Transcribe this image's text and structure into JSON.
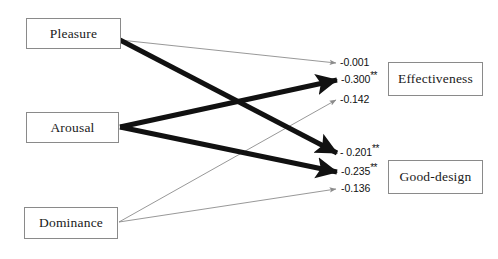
{
  "diagram": {
    "type": "path-diagram",
    "background_color": "#ffffff",
    "predictors": [
      {
        "id": "pleasure",
        "label": "Pleasure",
        "x": 26,
        "y": 18,
        "w": 95,
        "h": 31
      },
      {
        "id": "arousal",
        "label": "Arousal",
        "x": 26,
        "y": 112,
        "w": 93,
        "h": 31
      },
      {
        "id": "dominance",
        "label": "Dominance",
        "x": 24,
        "y": 207,
        "w": 94,
        "h": 32
      }
    ],
    "outcomes": [
      {
        "id": "effectiveness",
        "label": "Effectiveness",
        "x": 388,
        "y": 62,
        "w": 95,
        "h": 34
      },
      {
        "id": "good-design",
        "label": "Good-design",
        "x": 388,
        "y": 160,
        "w": 95,
        "h": 34
      }
    ],
    "paths": [
      {
        "id": "pleasure-effectiveness",
        "from": "pleasure",
        "to": "effectiveness",
        "coefficient": "-0.001",
        "stars": "",
        "significant": false,
        "weight": "thin",
        "stroke_width": 0.8,
        "color": "#7d7d7d",
        "x1": 120,
        "y1": 40,
        "x2": 336,
        "y2": 63,
        "label_x": 340,
        "label_y": 56
      },
      {
        "id": "arousal-effectiveness",
        "from": "arousal",
        "to": "effectiveness",
        "coefficient": "-0.300",
        "stars": "**",
        "significant": true,
        "weight": "thick",
        "stroke_width": 5.0,
        "color": "#111111",
        "x1": 120,
        "y1": 127,
        "x2": 337,
        "y2": 80,
        "label_x": 341,
        "label_y": 73
      },
      {
        "id": "dominance-effectiveness",
        "from": "dominance",
        "to": "effectiveness",
        "coefficient": "-0.142",
        "stars": "",
        "significant": false,
        "weight": "thin",
        "stroke_width": 0.8,
        "color": "#7d7d7d",
        "x1": 119,
        "y1": 222,
        "x2": 336,
        "y2": 100,
        "label_x": 340,
        "label_y": 93
      },
      {
        "id": "pleasure-good-design",
        "from": "pleasure",
        "to": "good-design",
        "coefficient": "- 0.201",
        "stars": "**",
        "significant": true,
        "weight": "thick",
        "stroke_width": 5.0,
        "color": "#111111",
        "x1": 120,
        "y1": 40,
        "x2": 337,
        "y2": 153,
        "label_x": 340,
        "label_y": 146
      },
      {
        "id": "arousal-good-design",
        "from": "arousal",
        "to": "good-design",
        "coefficient": "-0.235",
        "stars": "**",
        "significant": true,
        "weight": "thick",
        "stroke_width": 5.0,
        "color": "#111111",
        "x1": 120,
        "y1": 127,
        "x2": 337,
        "y2": 172,
        "label_x": 341,
        "label_y": 165
      },
      {
        "id": "dominance-good-design",
        "from": "dominance",
        "to": "good-design",
        "coefficient": "-0.136",
        "stars": "",
        "significant": false,
        "weight": "thin",
        "stroke_width": 0.8,
        "color": "#7d7d7d",
        "x1": 119,
        "y1": 222,
        "x2": 336,
        "y2": 189,
        "label_x": 341,
        "label_y": 182
      }
    ]
  }
}
